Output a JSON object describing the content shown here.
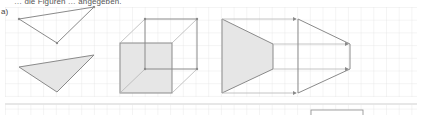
{
  "header": {
    "instruction_text_partial": "… die Figuren … angegeben.",
    "instruction_text_note": "Top line is cut off and not legible at source resolution; only fragments are readable."
  },
  "exercise": {
    "part_label": "a)"
  },
  "grid": {
    "cell_size_px": 12.7,
    "line_color": "#e3e3e3",
    "background": "#ffffff"
  },
  "colors": {
    "stroke": "#8a8a8a",
    "fill": "#e6e6e6",
    "arrow": "#8a8a8a"
  },
  "figures": [
    {
      "id": "triangle-pair",
      "description": "Triangle (outline) above, shaded mirrored triangle below"
    },
    {
      "id": "cube",
      "description": "Cube in oblique projection, front face shaded"
    },
    {
      "id": "trapezoid-pair",
      "description": "Shaded trapezoid with projection arrows to an outlined pentagon"
    }
  ],
  "answer_box": {
    "visible": true
  }
}
